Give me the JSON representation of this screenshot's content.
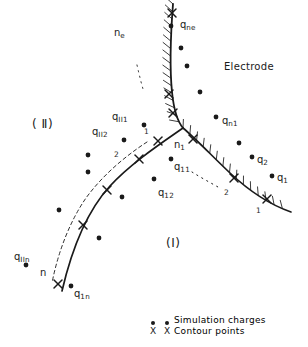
{
  "figure": {
    "width": 308,
    "height": 347,
    "background": "#ffffff",
    "ink_color": "#1a1a1a"
  },
  "regions": [
    {
      "name": "region-two",
      "label": "( Ⅱ)",
      "x": 32,
      "y": 118
    },
    {
      "name": "region-one",
      "label": "(I)",
      "x": 166,
      "y": 237
    }
  ],
  "electrode_label": {
    "text": "Electrode",
    "x": 224,
    "y": 62
  },
  "node_labels": [
    {
      "name": "node-ne",
      "base": "n",
      "sub": "e",
      "x": 114,
      "y": 28
    },
    {
      "name": "node-n1",
      "base": "n",
      "sub": "1",
      "x": 174,
      "y": 140
    },
    {
      "name": "node-n",
      "base": "n",
      "sub": "",
      "x": 40,
      "y": 268
    }
  ],
  "charge_labels": [
    {
      "name": "charge-qne",
      "base": "q",
      "sub": "ne",
      "x": 180,
      "y": 20
    },
    {
      "name": "charge-qII1",
      "base": "q",
      "sub": "II1",
      "x": 112,
      "y": 112
    },
    {
      "name": "charge-qII2",
      "base": "q",
      "sub": "II2",
      "x": 92,
      "y": 127
    },
    {
      "name": "charge-qn1",
      "base": "q",
      "sub": "n1",
      "x": 222,
      "y": 116
    },
    {
      "name": "charge-q2",
      "base": "q",
      "sub": "2",
      "x": 257,
      "y": 155
    },
    {
      "name": "charge-q1",
      "base": "q",
      "sub": "1",
      "x": 277,
      "y": 173
    },
    {
      "name": "charge-q11",
      "base": "q",
      "sub": "11",
      "x": 174,
      "y": 162
    },
    {
      "name": "charge-q12",
      "base": "q",
      "sub": "12",
      "x": 158,
      "y": 188
    },
    {
      "name": "charge-qIIn",
      "base": "q",
      "sub": "IIn",
      "x": 14,
      "y": 252
    },
    {
      "name": "charge-q1n",
      "base": "q",
      "sub": "1n",
      "x": 74,
      "y": 289
    }
  ],
  "index_labels": [
    {
      "name": "index-interface-1",
      "text": "1",
      "x": 144,
      "y": 128
    },
    {
      "name": "index-interface-2",
      "text": "2",
      "x": 114,
      "y": 151
    },
    {
      "name": "index-right-2",
      "text": "2",
      "x": 224,
      "y": 189
    },
    {
      "name": "index-right-1",
      "text": "1",
      "x": 256,
      "y": 207
    }
  ],
  "legend": {
    "items": [
      {
        "name": "legend-simulation-charges",
        "marker": "dot-icon",
        "label": "Simulation  charges",
        "x": 146,
        "y": 310
      },
      {
        "name": "legend-contour-points",
        "marker": "x-icon",
        "label": "Contour  points",
        "x": 146,
        "y": 326
      }
    ]
  },
  "curves": {
    "electrode_boundary": {
      "name": "electrode-boundary-curve",
      "path": "M 173 4 C 171 30, 169 62, 172 92 C 174 112, 178 122, 183 128",
      "hatched": true
    },
    "interface_left": {
      "name": "interface-left-curve",
      "path": "M 183 128 C 160 144, 130 164, 110 186 C 88 210, 72 248, 62 291"
    },
    "interface_right": {
      "name": "interface-right-curve",
      "path": "M 183 128 C 196 139, 212 156, 230 173 C 247 189, 268 204, 291 212",
      "hatched": true
    },
    "dashed_left": {
      "name": "dashed-auxiliary-curve",
      "path": "M 147 142 C 124 157, 102 176, 86 198 C 70 221, 58 252, 52 283"
    },
    "dotted_upper": {
      "name": "dotted-arc-upper",
      "path": "M 137 65 C 139 74, 141 82, 143 89"
    },
    "dotted_lower": {
      "name": "dotted-arc-lower",
      "path": "M 192 172 C 200 177, 209 182, 218 187"
    }
  },
  "contour_points": [
    {
      "x": 172,
      "y": 13
    },
    {
      "x": 169,
      "y": 94
    },
    {
      "x": 173,
      "y": 113
    },
    {
      "x": 158,
      "y": 141
    },
    {
      "x": 139,
      "y": 159
    },
    {
      "x": 107,
      "y": 190
    },
    {
      "x": 83,
      "y": 225
    },
    {
      "x": 58,
      "y": 284
    },
    {
      "x": 193,
      "y": 139
    },
    {
      "x": 234,
      "y": 178
    },
    {
      "x": 267,
      "y": 199
    }
  ],
  "simulation_charges": [
    {
      "x": 171,
      "y": 26
    },
    {
      "x": 181,
      "y": 48
    },
    {
      "x": 187,
      "y": 66
    },
    {
      "x": 200,
      "y": 92
    },
    {
      "x": 216,
      "y": 117
    },
    {
      "x": 239,
      "y": 143
    },
    {
      "x": 252,
      "y": 157
    },
    {
      "x": 272,
      "y": 176
    },
    {
      "x": 144,
      "y": 125
    },
    {
      "x": 124,
      "y": 140
    },
    {
      "x": 171,
      "y": 159
    },
    {
      "x": 154,
      "y": 179
    },
    {
      "x": 88,
      "y": 172
    },
    {
      "x": 122,
      "y": 197
    },
    {
      "x": 59,
      "y": 210
    },
    {
      "x": 99,
      "y": 238
    },
    {
      "x": 26,
      "y": 265
    },
    {
      "x": 71,
      "y": 286
    },
    {
      "x": 88,
      "y": 155
    }
  ]
}
